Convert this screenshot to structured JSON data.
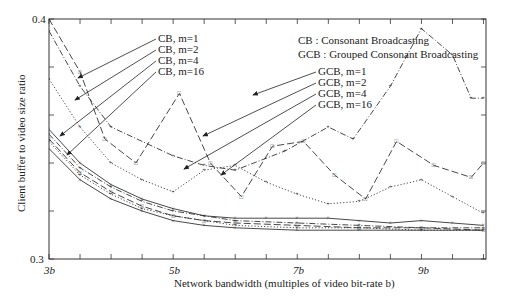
{
  "chart_data": {
    "type": "line",
    "title": "",
    "xlabel": "Network bandwidth (multiples of video bit-rate b)",
    "ylabel": "Client buffer to video size ratio",
    "xlim": [
      3,
      10.04
    ],
    "ylim": [
      0.3,
      0.4
    ],
    "xticks": [
      "3b",
      "5b",
      "7b",
      "9b"
    ],
    "yticks": [
      "0.3",
      "0.4"
    ],
    "legend_note": [
      "CB   :  Consonant Broadcasting",
      "GCB :  Grouped Consonant Broadcasting"
    ],
    "annotations_cb": [
      "CB, m=1",
      "CB, m=2",
      "CB, m=4",
      "CB, m=16"
    ],
    "annotations_gcb": [
      "GCB, m=1",
      "GCB, m=2",
      "GCB, m=4",
      "GCB, m=16"
    ],
    "series": [
      {
        "name": "GCB, m=1",
        "style": "dash-dot",
        "x": [
          3.0,
          3.5,
          4.0,
          5.0,
          5.5,
          6.0,
          6.8,
          7.5,
          7.9,
          8.5,
          9.0,
          9.5,
          9.8,
          10.0
        ],
        "y": [
          0.395,
          0.372,
          0.355,
          0.343,
          0.339,
          0.337,
          0.345,
          0.355,
          0.35,
          0.372,
          0.396,
          0.385,
          0.367,
          0.367
        ]
      },
      {
        "name": "GCB, m=2",
        "style": "long-dash",
        "x": [
          3.0,
          3.5,
          3.9,
          4.4,
          5.1,
          5.6,
          6.1,
          6.6,
          7.1,
          7.6,
          8.1,
          8.6,
          9.2,
          9.8,
          10.0
        ],
        "y": [
          0.4,
          0.378,
          0.35,
          0.34,
          0.369,
          0.34,
          0.326,
          0.347,
          0.349,
          0.335,
          0.325,
          0.349,
          0.339,
          0.334,
          0.34
        ]
      },
      {
        "name": "GCB, m=4",
        "style": "dotted",
        "x": [
          3.0,
          3.5,
          4.0,
          4.5,
          5.0,
          5.5,
          6.0,
          6.5,
          7.0,
          7.5,
          8.0,
          8.5,
          9.0,
          9.5,
          10.0
        ],
        "y": [
          0.375,
          0.355,
          0.34,
          0.333,
          0.328,
          0.337,
          0.339,
          0.332,
          0.327,
          0.323,
          0.324,
          0.33,
          0.333,
          0.326,
          0.319
        ]
      },
      {
        "name": "GCB, m=16",
        "style": "solid",
        "x": [
          3.0,
          3.5,
          4.0,
          4.5,
          5.0,
          5.5,
          6.0,
          6.5,
          7.0,
          7.5,
          8.0,
          8.5,
          9.0,
          9.5,
          10.0
        ],
        "y": [
          0.354,
          0.34,
          0.331,
          0.325,
          0.321,
          0.318,
          0.317,
          0.317,
          0.317,
          0.317,
          0.316,
          0.315,
          0.316,
          0.315,
          0.314
        ]
      },
      {
        "name": "CB, m=1",
        "style": "dash-dot",
        "x": [
          3.0,
          3.5,
          4.0,
          4.5,
          5.0,
          5.5,
          6.0,
          7.0,
          8.0,
          9.0,
          10.0
        ],
        "y": [
          0.352,
          0.338,
          0.33,
          0.324,
          0.32,
          0.318,
          0.316,
          0.315,
          0.314,
          0.313,
          0.313
        ]
      },
      {
        "name": "CB, m=2",
        "style": "long-dash",
        "x": [
          3.0,
          3.5,
          4.0,
          4.5,
          5.0,
          5.5,
          6.0,
          7.0,
          8.0,
          9.0,
          10.0
        ],
        "y": [
          0.35,
          0.336,
          0.328,
          0.322,
          0.318,
          0.316,
          0.315,
          0.314,
          0.313,
          0.313,
          0.312
        ]
      },
      {
        "name": "CB, m=4",
        "style": "dotted",
        "x": [
          3.0,
          3.5,
          4.0,
          4.5,
          5.0,
          5.5,
          6.0,
          7.0,
          8.0,
          9.0,
          10.0
        ],
        "y": [
          0.349,
          0.335,
          0.327,
          0.321,
          0.318,
          0.316,
          0.314,
          0.313,
          0.313,
          0.312,
          0.312
        ]
      },
      {
        "name": "CB, m=16",
        "style": "solid",
        "x": [
          3.0,
          3.5,
          4.0,
          4.5,
          5.0,
          5.5,
          6.0,
          7.0,
          8.0,
          9.0,
          10.0
        ],
        "y": [
          0.346,
          0.333,
          0.325,
          0.32,
          0.316,
          0.314,
          0.313,
          0.312,
          0.312,
          0.312,
          0.312
        ]
      }
    ],
    "grid": false,
    "legend_position": "annotated-arrows"
  }
}
